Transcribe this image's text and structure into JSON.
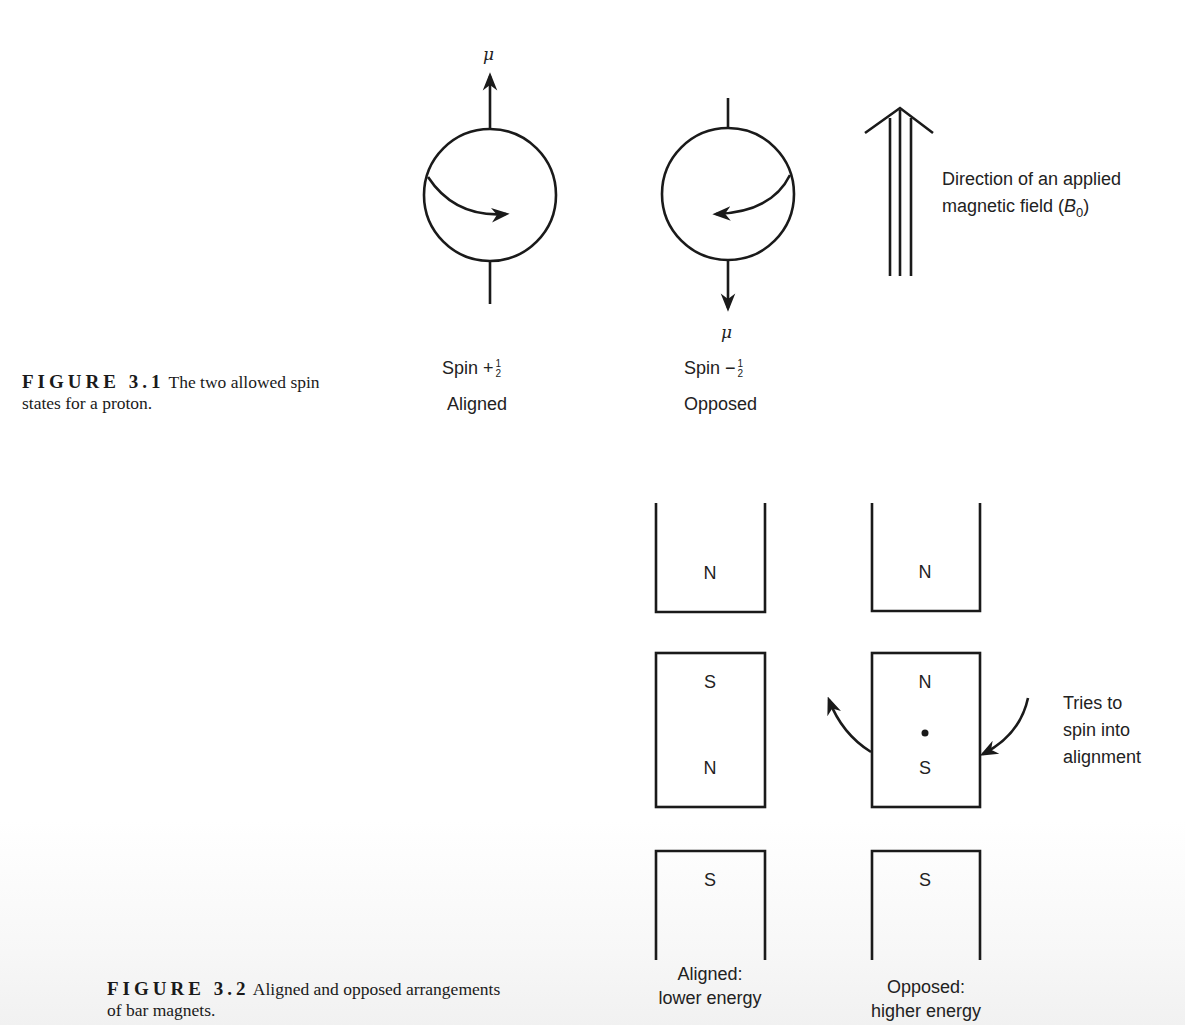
{
  "figure_3_1": {
    "caption_label": "FIGURE 3.1",
    "caption_text_line1": "The two allowed spin",
    "caption_text_line2": "states for a proton.",
    "moment_symbol": "μ",
    "spin_up": {
      "spin_text": "Spin +",
      "frac_num": "1",
      "frac_den": "2",
      "state": "Aligned"
    },
    "spin_down": {
      "spin_text": "Spin −",
      "frac_num": "1",
      "frac_den": "2",
      "state": "Opposed"
    },
    "field_label_line1": "Direction of an applied",
    "field_label_line2_prefix": "magnetic field (",
    "field_symbol": "B",
    "field_subscript": "0",
    "field_label_line2_suffix": ")"
  },
  "figure_3_2": {
    "caption_label": "FIGURE 3.2",
    "caption_text_line1": "Aligned and opposed arrangements",
    "caption_text_line2": "of bar magnets.",
    "aligned_column": {
      "top_magnet_pole": "N",
      "middle_magnet_poles": [
        "S",
        "N"
      ],
      "bottom_magnet_pole": "S",
      "label_line1": "Aligned:",
      "label_line2": "lower energy"
    },
    "opposed_column": {
      "top_magnet_pole": "N",
      "middle_magnet_poles": [
        "N",
        "S"
      ],
      "bottom_magnet_pole": "S",
      "label_line1": "Opposed:",
      "label_line2": "higher energy"
    },
    "rotation_note_line1": "Tries to",
    "rotation_note_line2": "spin into",
    "rotation_note_line3": "alignment"
  }
}
